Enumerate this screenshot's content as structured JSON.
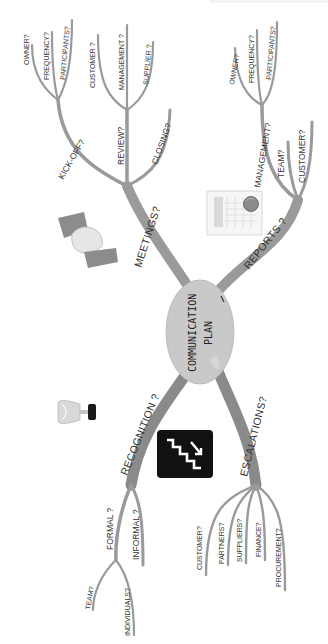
{
  "center": {
    "line1": "COMMUNICATION",
    "line2": "PLAN",
    "fill": "#c9c9c9"
  },
  "colors": {
    "branch": "#9a9a9a",
    "branch_dark": "#7c7c7c",
    "text": "#333333",
    "background": "#ffffff"
  },
  "meetings": {
    "label": "MEETINGS?",
    "icon": "handshake-icon",
    "kickoff": {
      "label": "KICK-OFF?",
      "children": [
        "OWNER?",
        "FREQUENCY?",
        "PARTICIPANTS?"
      ]
    },
    "review": {
      "label": "REVIEW?",
      "children": [
        "CUSTOMER ?",
        "MANAGEMENT ?",
        "SUPPLIER ?"
      ]
    },
    "closing": {
      "label": "CLOSING?"
    }
  },
  "reports": {
    "label": "REPORTS ?",
    "icon": "report-chart-icon",
    "management": {
      "label": "MANAGEMENT?",
      "children": [
        "OWNER?",
        "FREQUENCY?",
        "PARTICIPANTS?"
      ]
    },
    "team": {
      "label": "TEAM?"
    },
    "customer": {
      "label": "CUSTOMER?"
    }
  },
  "recognition": {
    "label": "RECOGNITION ?",
    "icon": "trophy-icon",
    "formal": {
      "label": "FORMAL ?",
      "children": [
        "TEAM?",
        "INDIVIDUALS?"
      ]
    },
    "informal": {
      "label": "INFORMAL ?"
    }
  },
  "escalations": {
    "label": "ESCALATIONS?",
    "icon": "stairs-up-icon",
    "children": [
      "CUSTOMER?",
      "PARTNERS?",
      "SUPPLIERS?",
      "FINANCE?",
      "PROCUREMENT?"
    ]
  }
}
